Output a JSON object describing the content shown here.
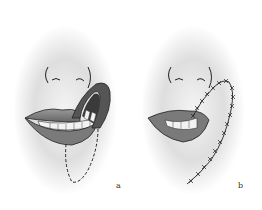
{
  "figure": {
    "panels": [
      {
        "id": "a",
        "label": "a",
        "description": "Lower lip with rotated full-thickness flap and dashed incision line below"
      },
      {
        "id": "b",
        "label": "b",
        "description": "Lip after flap transposition with sutured incision lines"
      }
    ]
  },
  "colors": {
    "background": "#ffffff",
    "skin_shade": "#c8c8c8",
    "lip": "#8a8a8a",
    "lip_dark": "#555555",
    "teeth": "#f2f2f2",
    "outline": "#222222"
  }
}
